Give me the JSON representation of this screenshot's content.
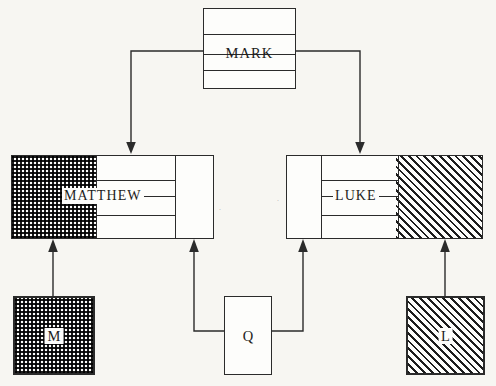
{
  "diagram": {
    "type": "source-criticism-diagram",
    "background_color": "#f7f6f2",
    "ink_color": "#2b2b2b",
    "nodes": {
      "mark": {
        "label": "MARK",
        "fill": "white",
        "shape": "stacked-rectangle",
        "rules": 3
      },
      "matthew": {
        "label": "MATTHEW",
        "shape": "composite-rectangle",
        "segments": [
          {
            "name": "m-source-portion",
            "fill": "checkered"
          },
          {
            "name": "mark-portion",
            "fill": "white"
          },
          {
            "name": "q-portion",
            "fill": "white"
          }
        ]
      },
      "luke": {
        "label": "LUKE",
        "shape": "composite-rectangle",
        "segments": [
          {
            "name": "q-portion",
            "fill": "white"
          },
          {
            "name": "mark-portion",
            "fill": "white"
          },
          {
            "name": "l-source-portion",
            "fill": "diagonal-hatch"
          }
        ]
      },
      "m_source": {
        "label": "M",
        "fill": "checkered"
      },
      "q_source": {
        "label": "Q",
        "fill": "white"
      },
      "l_source": {
        "label": "L",
        "fill": "diagonal-hatch"
      }
    },
    "edges": [
      {
        "name": "mark-to-matthew",
        "from": "MARK",
        "to": "MATTHEW",
        "arrow": "down"
      },
      {
        "name": "mark-to-luke",
        "from": "MARK",
        "to": "LUKE",
        "arrow": "down"
      },
      {
        "name": "m-to-matthew",
        "from": "M",
        "to": "MATTHEW",
        "arrow": "up"
      },
      {
        "name": "q-to-matthew",
        "from": "Q",
        "to": "MATTHEW",
        "arrow": "up"
      },
      {
        "name": "q-to-luke",
        "from": "Q",
        "to": "LUKE",
        "arrow": "up"
      },
      {
        "name": "l-to-luke",
        "from": "L",
        "to": "LUKE",
        "arrow": "up"
      }
    ]
  }
}
